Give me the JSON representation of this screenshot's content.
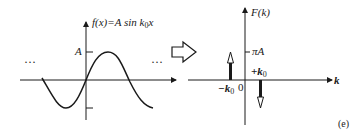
{
  "figure": {
    "panel_label": "(e)",
    "transform_arrow": "fourier-transform-arrow"
  },
  "left_plot": {
    "function_label_prefix": "f(x)=A sin ",
    "function_label_k": "k",
    "function_label_sub": "0",
    "function_label_suffix": "x",
    "amplitude_label": "A",
    "ellipsis_left": "···",
    "ellipsis_right": "···"
  },
  "right_plot": {
    "y_axis_label": "F(k)",
    "x_axis_label": "k",
    "amplitude_label": "πA",
    "pos_freq_label": "+k",
    "pos_freq_sub": "0",
    "neg_freq_label": "−k",
    "neg_freq_sub": "0",
    "origin_label": "0"
  },
  "colors": {
    "ink": "#1a1a1a",
    "background": "#ffffff"
  }
}
